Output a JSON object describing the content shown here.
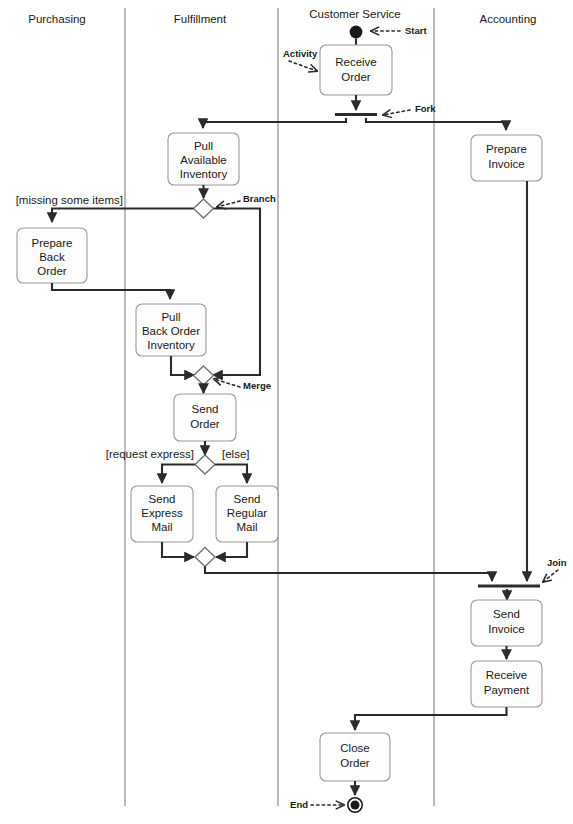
{
  "diagram": {
    "type": "uml-activity-diagram",
    "width": 573,
    "height": 824,
    "background_color": "#ffffff",
    "line_color": "#2b2b2b",
    "box_stroke_color": "#9a9a9a",
    "box_fill_color": "#fdfdfd",
    "lane_divider_color": "#8c8c8c"
  },
  "lanes": [
    {
      "id": "purchasing",
      "label": "Purchasing"
    },
    {
      "id": "fulfillment",
      "label": "Fulfillment"
    },
    {
      "id": "customer-service",
      "label": "Customer Service"
    },
    {
      "id": "accounting",
      "label": "Accounting"
    }
  ],
  "activities": [
    {
      "id": "receive-order",
      "lane": "customer-service",
      "lines": [
        "Receive",
        "Order"
      ]
    },
    {
      "id": "pull-available-inventory",
      "lane": "fulfillment",
      "lines": [
        "Pull",
        "Available",
        "Inventory"
      ]
    },
    {
      "id": "prepare-back-order",
      "lane": "purchasing",
      "lines": [
        "Prepare",
        "Back",
        "Order"
      ]
    },
    {
      "id": "pull-back-order-inventory",
      "lane": "fulfillment",
      "lines": [
        "Pull",
        "Back Order",
        "Inventory"
      ]
    },
    {
      "id": "send-order",
      "lane": "fulfillment",
      "lines": [
        "Send",
        "Order"
      ]
    },
    {
      "id": "send-express-mail",
      "lane": "fulfillment",
      "lines": [
        "Send",
        "Express",
        "Mail"
      ]
    },
    {
      "id": "send-regular-mail",
      "lane": "fulfillment",
      "lines": [
        "Send",
        "Regular",
        "Mail"
      ]
    },
    {
      "id": "prepare-invoice",
      "lane": "accounting",
      "lines": [
        "Prepare",
        "Invoice"
      ]
    },
    {
      "id": "send-invoice",
      "lane": "accounting",
      "lines": [
        "Send",
        "Invoice"
      ]
    },
    {
      "id": "receive-payment",
      "lane": "accounting",
      "lines": [
        "Receive",
        "Payment"
      ]
    },
    {
      "id": "close-order",
      "lane": "customer-service",
      "lines": [
        "Close",
        "Order"
      ]
    }
  ],
  "guards": [
    {
      "id": "missing-some-items",
      "label": "[missing some items]"
    },
    {
      "id": "request-express",
      "label": "[request express]"
    },
    {
      "id": "else",
      "label": "[else]"
    }
  ],
  "annotations": [
    {
      "id": "start",
      "label": "Start"
    },
    {
      "id": "activity",
      "label": "Activity"
    },
    {
      "id": "fork",
      "label": "Fork"
    },
    {
      "id": "branch",
      "label": "Branch"
    },
    {
      "id": "merge",
      "label": "Merge"
    },
    {
      "id": "join",
      "label": "Join"
    },
    {
      "id": "end",
      "label": "End"
    }
  ],
  "control_nodes": [
    {
      "id": "start-node",
      "kind": "initial-node"
    },
    {
      "id": "fork-bar",
      "kind": "fork"
    },
    {
      "id": "branch-node",
      "kind": "decision"
    },
    {
      "id": "merge-node",
      "kind": "merge"
    },
    {
      "id": "mail-branch-node",
      "kind": "decision"
    },
    {
      "id": "mail-merge-node",
      "kind": "merge"
    },
    {
      "id": "join-bar",
      "kind": "join"
    },
    {
      "id": "end-node",
      "kind": "final-node"
    }
  ]
}
